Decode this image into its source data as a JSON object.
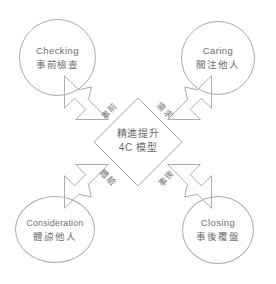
{
  "diagram": {
    "type": "four-quadrant-arrow-cycle",
    "center": {
      "line1": "精進提升",
      "line2": "4C 模型"
    },
    "nodes": [
      {
        "id": "checking",
        "en": "Checking",
        "zh": "事前檢查",
        "position": "top-left"
      },
      {
        "id": "caring",
        "en": "Caring",
        "zh": "關注他人",
        "position": "top-right"
      },
      {
        "id": "consideration",
        "en": "Consideration",
        "zh": "體諒他人",
        "position": "bottom-left"
      },
      {
        "id": "closing",
        "en": "Closing",
        "zh": "事後覆盤",
        "position": "bottom-right"
      }
    ],
    "arrows": [
      {
        "id": "pre",
        "label": "事前",
        "direction": "up-left"
      },
      {
        "id": "need",
        "label": "需求",
        "direction": "up-right"
      },
      {
        "id": "exp",
        "label": "體驗",
        "direction": "down-left"
      },
      {
        "id": "post",
        "label": "事後",
        "direction": "down-right"
      }
    ],
    "colors": {
      "stroke": "#ababab",
      "text": "#6d6d6d",
      "background": "#ffffff"
    }
  }
}
